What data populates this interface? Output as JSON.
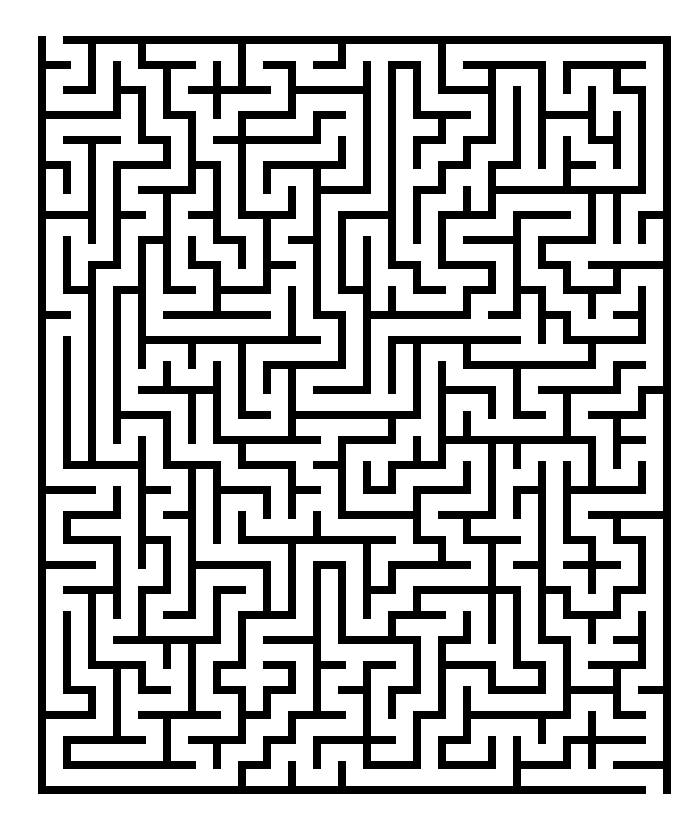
{
  "page": {
    "background_color": "#ffffff",
    "width": 695,
    "height": 815,
    "title": "Maze"
  },
  "maze": {
    "name": "rectangular-grid-maze",
    "type": "perfect-maze",
    "wall_color": "#000000",
    "passage_color": "#ffffff",
    "columns": 25,
    "rows": 30,
    "cell_pitch_px": 25,
    "wall_thickness_px": 8,
    "origin_x_px": 38,
    "origin_y_px": 36,
    "width_px": 620,
    "height_px": 750,
    "entrance": {
      "label": "entrance",
      "side": "top",
      "column": 0,
      "row": 0
    },
    "exit": {
      "label": "exit",
      "side": "bottom",
      "column": 24,
      "row": 29
    },
    "border": {
      "top": true,
      "right": true,
      "bottom": true,
      "left": true
    },
    "seed": 20240617,
    "description": "Dense black-and-white rectangular grid maze with a single opening in the top border at the leftmost column."
  }
}
